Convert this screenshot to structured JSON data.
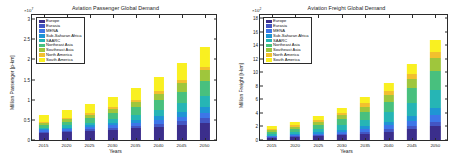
{
  "figure": {
    "xlabel": "Years",
    "years": [
      "2015",
      "2020",
      "2025",
      "2030",
      "2035",
      "2040",
      "2045",
      "2050"
    ],
    "series_names": [
      "Europe",
      "Eurasia",
      "MENA",
      "Sub-Saharan Africa",
      "SAARC",
      "Northeast Asia",
      "Southeast Asia",
      "North America",
      "South America"
    ],
    "series_colors": [
      "#3b2e8c",
      "#4356c4",
      "#3d76e8",
      "#1f95d4",
      "#26b5b5",
      "#48c07e",
      "#9fc63c",
      "#f2c02e",
      "#f9f021"
    ]
  },
  "chart_data": [
    {
      "type": "bar",
      "stacked": true,
      "panel": "left",
      "title": "Aviation Passenger Global Demand",
      "xlabel": "Years",
      "ylabel": "Million Passenger [p-km]",
      "y_exponent": "×10",
      "y_exponent_power": "7",
      "categories": [
        "2015",
        "2020",
        "2025",
        "2030",
        "2035",
        "2040",
        "2045",
        "2050"
      ],
      "yticks": [
        0,
        0.5,
        1,
        1.5,
        2,
        2.5,
        3
      ],
      "ytick_labels": [
        "0",
        "0.5",
        "1",
        "1.5",
        "2",
        "2.5",
        "3"
      ],
      "ylim": [
        0,
        3.1
      ],
      "grid": false,
      "legend_position": "upper left",
      "series": [
        {
          "name": "Europe",
          "color": "#3b2e8c",
          "values": [
            0.175,
            0.2,
            0.225,
            0.255,
            0.29,
            0.33,
            0.375,
            0.43
          ]
        },
        {
          "name": "Eurasia",
          "color": "#4356c4",
          "values": [
            0.03,
            0.036,
            0.043,
            0.051,
            0.061,
            0.073,
            0.087,
            0.104
          ]
        },
        {
          "name": "MENA",
          "color": "#3d76e8",
          "values": [
            0.032,
            0.04,
            0.05,
            0.062,
            0.077,
            0.095,
            0.117,
            0.144
          ]
        },
        {
          "name": "Sub-Saharan Africa",
          "color": "#1f95d4",
          "values": [
            0.025,
            0.033,
            0.043,
            0.056,
            0.072,
            0.093,
            0.119,
            0.152
          ]
        },
        {
          "name": "SAARC",
          "color": "#26b5b5",
          "values": [
            0.04,
            0.054,
            0.072,
            0.095,
            0.125,
            0.163,
            0.212,
            0.274
          ]
        },
        {
          "name": "Northeast Asia",
          "color": "#48c07e",
          "values": [
            0.07,
            0.09,
            0.115,
            0.146,
            0.184,
            0.231,
            0.289,
            0.36
          ]
        },
        {
          "name": "Southeast Asia",
          "color": "#9fc63c",
          "values": [
            0.045,
            0.059,
            0.077,
            0.099,
            0.127,
            0.162,
            0.206,
            0.261
          ]
        },
        {
          "name": "North America",
          "color": "#f2c02e",
          "values": [
            0.03,
            0.035,
            0.041,
            0.048,
            0.056,
            0.066,
            0.077,
            0.09
          ]
        },
        {
          "name": "South America",
          "color": "#f9f021",
          "values": [
            0.173,
            0.203,
            0.234,
            0.268,
            0.308,
            0.347,
            0.418,
            0.485
          ]
        }
      ]
    },
    {
      "type": "bar",
      "stacked": true,
      "panel": "right",
      "title": "Aviation Freight Global Demand",
      "xlabel": "Years",
      "ylabel": "Million Freight [t-km]",
      "y_exponent": "×10",
      "y_exponent_power": "2",
      "categories": [
        "2015",
        "2020",
        "2025",
        "2030",
        "2035",
        "2040",
        "2045",
        "2050"
      ],
      "yticks": [
        0,
        2,
        4,
        6,
        8,
        10,
        12,
        14,
        16,
        18
      ],
      "ytick_labels": [
        "0",
        "2",
        "4",
        "6",
        "8",
        "10",
        "12",
        "14",
        "16",
        "18"
      ],
      "ylim": [
        0,
        18.5
      ],
      "grid": false,
      "legend_position": "upper left",
      "series": [
        {
          "name": "Europe",
          "color": "#3b2e8c",
          "values": [
            0.33,
            0.42,
            0.55,
            0.72,
            0.95,
            1.25,
            1.62,
            2.1
          ]
        },
        {
          "name": "Eurasia",
          "color": "#4356c4",
          "values": [
            0.09,
            0.12,
            0.16,
            0.21,
            0.28,
            0.37,
            0.49,
            0.64
          ]
        },
        {
          "name": "MENA",
          "color": "#3d76e8",
          "values": [
            0.13,
            0.17,
            0.23,
            0.31,
            0.42,
            0.56,
            0.74,
            0.98
          ]
        },
        {
          "name": "Sub-Saharan Africa",
          "color": "#1f95d4",
          "values": [
            0.11,
            0.15,
            0.21,
            0.29,
            0.4,
            0.55,
            0.75,
            1.02
          ]
        },
        {
          "name": "SAARC",
          "color": "#26b5b5",
          "values": [
            0.26,
            0.36,
            0.5,
            0.7,
            0.98,
            1.37,
            1.9,
            2.62
          ]
        },
        {
          "name": "Northeast Asia",
          "color": "#48c07e",
          "values": [
            0.34,
            0.46,
            0.63,
            0.86,
            1.17,
            1.58,
            2.13,
            2.86
          ]
        },
        {
          "name": "Southeast Asia",
          "color": "#9fc63c",
          "values": [
            0.22,
            0.3,
            0.41,
            0.56,
            0.76,
            1.03,
            1.39,
            1.86
          ]
        },
        {
          "name": "North America",
          "color": "#f2c02e",
          "values": [
            0.19,
            0.24,
            0.3,
            0.38,
            0.48,
            0.6,
            0.75,
            0.94
          ]
        },
        {
          "name": "South America",
          "color": "#f9f021",
          "values": [
            0.38,
            0.48,
            0.61,
            0.77,
            0.96,
            1.19,
            1.48,
            1.83
          ]
        }
      ]
    }
  ]
}
